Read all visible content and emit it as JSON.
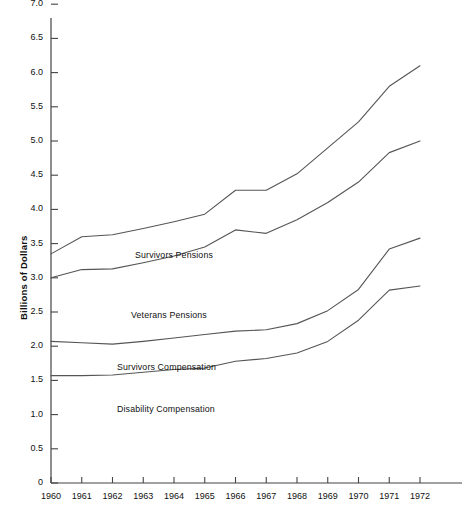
{
  "chart_data": {
    "type": "line",
    "title": "",
    "subtitle": "",
    "xlabel": "",
    "ylabel": "Billions of Dollars",
    "x": [
      1960,
      1961,
      1962,
      1963,
      1964,
      1965,
      1966,
      1967,
      1968,
      1969,
      1970,
      1971,
      1972
    ],
    "xlim": [
      1960,
      1972
    ],
    "ylim": [
      0,
      7.3
    ],
    "grid": false,
    "legend_position": "inline-annotations",
    "xtick_labels": [
      "1960",
      "1961",
      "1962",
      "1963",
      "1964",
      "1965",
      "1966",
      "1967",
      "1968",
      "1969",
      "1970",
      "1971",
      "1972"
    ],
    "ytick_labels": [
      "0",
      "0.5",
      "1.0",
      "1.5",
      "2.0",
      "2.5",
      "3.0",
      "3.5",
      "4.0",
      "4.5",
      "5.0",
      "5.5",
      "6.0",
      "6.5",
      "7.0"
    ],
    "ytick_values": [
      0,
      0.5,
      1.0,
      1.5,
      2.0,
      2.5,
      3.0,
      3.5,
      4.0,
      4.5,
      5.0,
      5.5,
      6.0,
      6.5,
      7.0
    ],
    "line_color": "#555555",
    "axis_color": "#444444",
    "note": "Cumulative stacked totals: each line is a running total of the programs beneath it.",
    "series": [
      {
        "name": "Survivors Pensions",
        "label": "Survivors Pensions",
        "label_x": 135,
        "label_y": 256,
        "values": [
          3.35,
          3.6,
          3.63,
          3.72,
          3.82,
          3.93,
          4.28,
          4.28,
          4.52,
          4.9,
          5.28,
          5.8,
          6.1
        ]
      },
      {
        "name": "Veterans Pensions",
        "label": "Veterans Pensions",
        "label_x": 131,
        "label_y": 316,
        "values": [
          3.0,
          3.12,
          3.13,
          3.22,
          3.32,
          3.45,
          3.7,
          3.65,
          3.85,
          4.1,
          4.4,
          4.83,
          5.0
        ]
      },
      {
        "name": "Survivors Compensation",
        "label": "Survivors Compensation",
        "label_x": 117,
        "label_y": 368,
        "values": [
          2.07,
          2.05,
          2.03,
          2.07,
          2.12,
          2.17,
          2.22,
          2.24,
          2.33,
          2.52,
          2.83,
          3.42,
          3.58
        ]
      },
      {
        "name": "Disability Compensation",
        "label": "Disability Compensation",
        "label_x": 117,
        "label_y": 410,
        "values": [
          1.57,
          1.57,
          1.58,
          1.62,
          1.66,
          1.68,
          1.78,
          1.82,
          1.9,
          2.07,
          2.38,
          2.82,
          2.88
        ]
      }
    ]
  },
  "axis": {
    "y_title": "Billions of Dollars"
  }
}
